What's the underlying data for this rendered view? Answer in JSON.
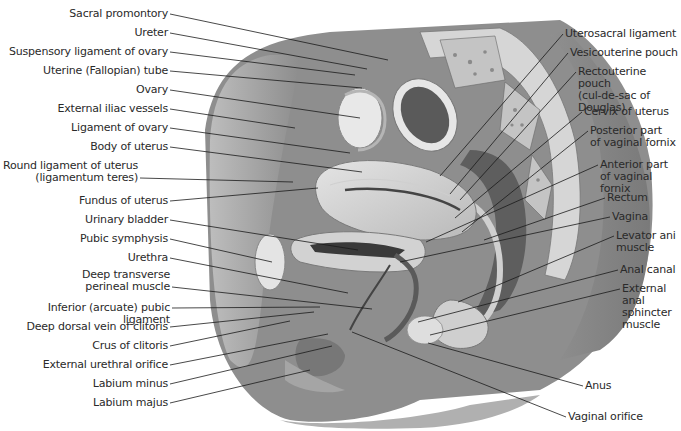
{
  "figure": {
    "left_labels": [
      {
        "id": "sacral-promontory",
        "text": "Sacral promontory",
        "x": 168,
        "y": 14,
        "tx": 388,
        "ty": 60
      },
      {
        "id": "ureter",
        "text": "Ureter",
        "x": 168,
        "y": 33,
        "tx": 367,
        "ty": 69
      },
      {
        "id": "suspensory-ligament-of-ovary",
        "text": "Suspensory ligament of ovary",
        "x": 168,
        "y": 52,
        "tx": 355,
        "ty": 75
      },
      {
        "id": "uterine-tube",
        "text": "Uterine (Fallopian) tube",
        "x": 168,
        "y": 71,
        "tx": 362,
        "ty": 88
      },
      {
        "id": "ovary",
        "text": "Ovary",
        "x": 168,
        "y": 90,
        "tx": 360,
        "ty": 118
      },
      {
        "id": "external-iliac-vessels",
        "text": "External iliac vessels",
        "x": 168,
        "y": 109,
        "tx": 295,
        "ty": 128
      },
      {
        "id": "ligament-of-ovary",
        "text": "Ligament of ovary",
        "x": 168,
        "y": 128,
        "tx": 350,
        "ty": 153
      },
      {
        "id": "body-of-uterus",
        "text": "Body of uterus",
        "x": 168,
        "y": 147,
        "tx": 362,
        "ty": 172
      },
      {
        "id": "round-ligament-of-uterus",
        "text": "Round ligament of uterus\n(ligamentum teres)",
        "x": 138,
        "y": 166,
        "tx": 293,
        "ty": 182
      },
      {
        "id": "fundus-of-uterus",
        "text": "Fundus of uterus",
        "x": 168,
        "y": 201,
        "tx": 318,
        "ty": 188
      },
      {
        "id": "urinary-bladder",
        "text": "Urinary bladder",
        "x": 168,
        "y": 220,
        "tx": 358,
        "ty": 250
      },
      {
        "id": "pubic-symphysis",
        "text": "Pubic symphysis",
        "x": 168,
        "y": 239,
        "tx": 272,
        "ty": 262
      },
      {
        "id": "urethra",
        "text": "Urethra",
        "x": 168,
        "y": 258,
        "tx": 348,
        "ty": 293
      },
      {
        "id": "deep-transverse-perineal-muscle",
        "text": "Deep transverse\nperineal muscle",
        "x": 170,
        "y": 275,
        "tx": 372,
        "ty": 309
      },
      {
        "id": "inferior-pubic-ligament",
        "text": "Inferior (arcuate) pubic ligament",
        "x": 170,
        "y": 308,
        "tx": 320,
        "ty": 307
      },
      {
        "id": "deep-dorsal-vein-of-clitoris",
        "text": "Deep dorsal vein of clitoris",
        "x": 168,
        "y": 327,
        "tx": 314,
        "ty": 312
      },
      {
        "id": "crus-of-clitoris",
        "text": "Crus of clitoris",
        "x": 168,
        "y": 346,
        "tx": 290,
        "ty": 321
      },
      {
        "id": "external-urethral-orifice",
        "text": "External urethral orifice",
        "x": 168,
        "y": 365,
        "tx": 328,
        "ty": 334
      },
      {
        "id": "labium-minus",
        "text": "Labium minus",
        "x": 168,
        "y": 384,
        "tx": 332,
        "ty": 346
      },
      {
        "id": "labium-majus",
        "text": "Labium majus",
        "x": 168,
        "y": 403,
        "tx": 310,
        "ty": 370
      }
    ],
    "right_labels": [
      {
        "id": "uterosacral-ligament",
        "text": "Uterosacral ligament",
        "x": 565,
        "y": 34,
        "tx": 440,
        "ty": 176
      },
      {
        "id": "vesicouterine-pouch",
        "text": "Vesicouterine pouch",
        "x": 570,
        "y": 53,
        "tx": 450,
        "ty": 194
      },
      {
        "id": "rectouterine-pouch",
        "text": "Rectouterine pouch\n(cul-de-sac of\nDouglas)",
        "x": 578,
        "y": 72,
        "tx": 460,
        "ty": 200
      },
      {
        "id": "cervix-of-uterus",
        "text": "Cervix of uterus",
        "x": 584,
        "y": 112,
        "tx": 455,
        "ty": 218
      },
      {
        "id": "posterior-vaginal-fornix",
        "text": "Posterior part\nof vaginal fornix",
        "x": 590,
        "y": 131,
        "tx": 462,
        "ty": 232
      },
      {
        "id": "anterior-vaginal-fornix",
        "text": "Anterior part\nof vaginal fornix",
        "x": 600,
        "y": 165,
        "tx": 426,
        "ty": 242
      },
      {
        "id": "rectum",
        "text": "Rectum",
        "x": 607,
        "y": 198,
        "tx": 484,
        "ty": 240
      },
      {
        "id": "vagina",
        "text": "Vagina",
        "x": 612,
        "y": 217,
        "tx": 400,
        "ty": 262
      },
      {
        "id": "levator-ani-muscle",
        "text": "Levator ani\nmuscle",
        "x": 616,
        "y": 236,
        "tx": 458,
        "ty": 302
      },
      {
        "id": "anal-canal",
        "text": "Anal canal",
        "x": 620,
        "y": 270,
        "tx": 418,
        "ty": 322
      },
      {
        "id": "external-anal-sphincter",
        "text": "External\nanal\nsphincter\nmuscle",
        "x": 622,
        "y": 289,
        "tx": 430,
        "ty": 335
      },
      {
        "id": "anus",
        "text": "Anus",
        "x": 585,
        "y": 386,
        "tx": 428,
        "ty": 343
      },
      {
        "id": "vaginal-orifice",
        "text": "Vaginal orifice",
        "x": 568,
        "y": 417,
        "tx": 352,
        "ty": 332
      }
    ],
    "colors": {
      "background": "#ffffff",
      "label_text": "#2a2a2a",
      "leader_line": "#1a1a1a",
      "tissue_dark": "#6e6e6e",
      "tissue_mid": "#9a9a9a",
      "tissue_light": "#c8c8c8",
      "tissue_pale": "#e2e2e2"
    }
  }
}
